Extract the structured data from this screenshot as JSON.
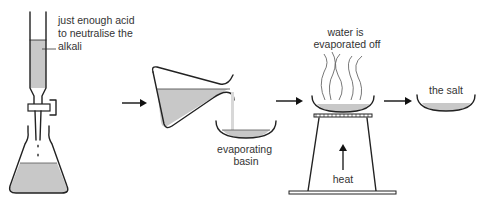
{
  "diagram": {
    "steps": [
      {
        "id": "titration",
        "label_lines": [
          "just enough acid",
          "to neutralise the",
          "alkali"
        ]
      },
      {
        "id": "pour",
        "label_lines": [
          "evaporating",
          "basin"
        ]
      },
      {
        "id": "evaporate",
        "label_lines": [
          "water is",
          "evaporated off"
        ],
        "heat_label": "heat"
      },
      {
        "id": "result",
        "label_lines": [
          "the salt"
        ]
      }
    ],
    "colors": {
      "liquid": "#c8c8c8",
      "outline": "#222222",
      "text": "#333333"
    }
  }
}
